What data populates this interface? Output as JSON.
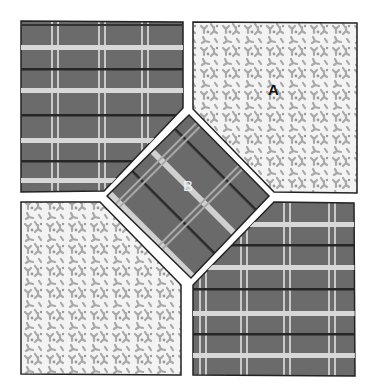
{
  "figure": {
    "labels": {
      "a": "A",
      "b": "B"
    },
    "patches": [
      {
        "id": "top-left",
        "fabric": "plaid"
      },
      {
        "id": "top-right",
        "fabric": "floral",
        "label": "A"
      },
      {
        "id": "center",
        "fabric": "plaid-diagonal",
        "label": "B"
      },
      {
        "id": "bottom-left",
        "fabric": "floral"
      },
      {
        "id": "bottom-right",
        "fabric": "plaid"
      }
    ],
    "colors": {
      "plaid_base": "#6e6e6e",
      "plaid_light_stripe": "#d6d6d6",
      "plaid_dark_stripe": "#2a2a2a",
      "floral_base": "#f2f2f2",
      "floral_motif": "#a8a8a8",
      "outline": "#222222",
      "gap": "#ffffff"
    }
  }
}
